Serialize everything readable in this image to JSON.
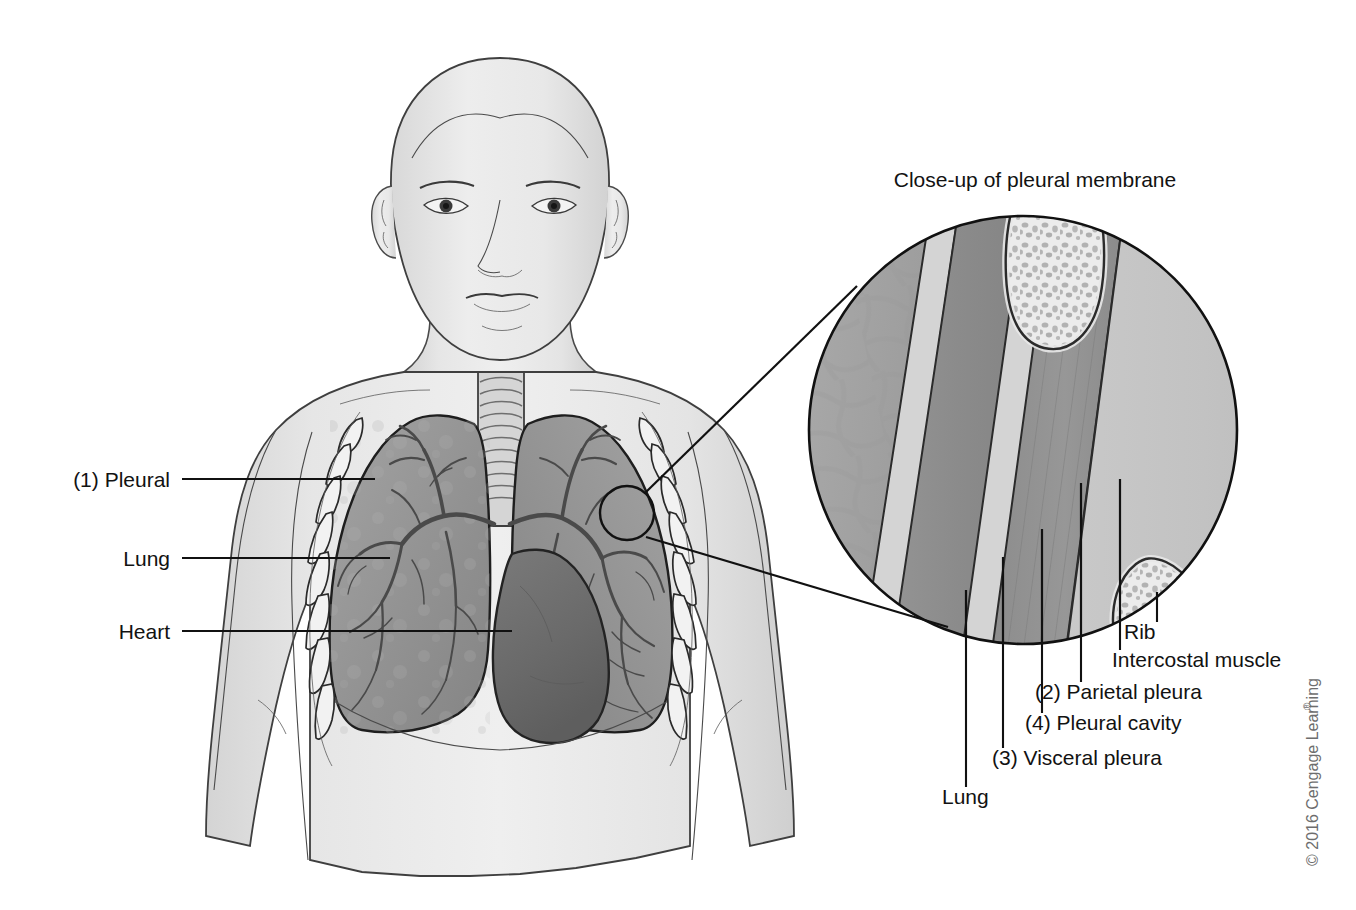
{
  "figure": {
    "title_caption": "Close-up of pleural membrane",
    "copyright": "© 2016 Cengage Learning",
    "copyright_mark": "®"
  },
  "left_labels": [
    {
      "id": "pleural",
      "text": "(1) Pleural",
      "text_x": 170,
      "text_y": 487,
      "line_x1": 182,
      "line_y1": 479,
      "line_x2": 375,
      "line_y2": 479
    },
    {
      "id": "lung",
      "text": "Lung",
      "text_x": 170,
      "text_y": 566,
      "line_x1": 182,
      "line_y1": 558,
      "line_x2": 390,
      "line_y2": 558
    },
    {
      "id": "heart",
      "text": "Heart",
      "text_x": 170,
      "text_y": 639,
      "line_x1": 182,
      "line_y1": 631,
      "line_x2": 510,
      "line_y2": 631
    }
  ],
  "right_labels": [
    {
      "id": "rib",
      "text": "Rib",
      "text_x": 1124,
      "text_y": 639,
      "line_x": 1157,
      "line_y1": 592,
      "line_y2": 622
    },
    {
      "id": "intercostal-muscle",
      "text": "Intercostal muscle",
      "text_x": 1112,
      "text_y": 667,
      "line_x": 1120,
      "line_y1": 479,
      "line_y2": 650
    },
    {
      "id": "parietal-pleura",
      "text": "(2) Parietal pleura",
      "text_x": 1035,
      "text_y": 699,
      "line_x": 1081,
      "line_y1": 483,
      "line_y2": 682
    },
    {
      "id": "pleural-cavity",
      "text": "(4) Pleural cavity",
      "text_x": 1025,
      "text_y": 730,
      "line_x": 1042,
      "line_y1": 529,
      "line_y2": 713
    },
    {
      "id": "visceral-pleura",
      "text": "(3) Visceral pleura",
      "text_x": 992,
      "text_y": 765,
      "line_x": 1003,
      "line_y1": 557,
      "line_y2": 748
    },
    {
      "id": "lung-closeup",
      "text": "Lung",
      "text_x": 942,
      "text_y": 804,
      "line_x": 966,
      "line_y1": 590,
      "line_y2": 787
    }
  ],
  "geometry": {
    "big_circle": {
      "cx": 1023,
      "cy": 430,
      "r": 216
    },
    "small_circle": {
      "cx": 627,
      "cy": 513,
      "r": 28
    },
    "tangent_upper": {
      "x1": 646,
      "y1": 492,
      "x2": 855,
      "y2": 288
    },
    "tangent_lower": {
      "x1": 646,
      "y1": 536,
      "x2": 945,
      "y2": 625
    }
  },
  "palette": {
    "paper": "#ffffff",
    "outline": "#111111",
    "body_skin": "#e9e9e9",
    "body_shade": "#d2d2d2",
    "lung_tissue": "#9b9b9b",
    "lung_dark": "#7a7a7a",
    "heart": "#6e6e6e",
    "trachea": "#cfcfcf",
    "rib_bone": "#e2e2e2",
    "rib_trabecula": "#b4b4b4",
    "closeup_lung": "#a8a8a8",
    "visceral_pleura": "#cfcfcf",
    "pleural_cavity": "#8e8e8e",
    "parietal_pleura": "#cccccc",
    "intercostal_muscle": "#9a9a9a",
    "subcutaneous": "#c4c4c4",
    "label_text": "#121212",
    "copyright_text": "#6d6d6d"
  },
  "closeup_layers": [
    {
      "name": "Lung",
      "key": "lung",
      "fill": "#a8a8a8"
    },
    {
      "name": "Visceral pleura",
      "key": "visceral_pleura",
      "fill": "#cfcfcf"
    },
    {
      "name": "Pleural cavity",
      "key": "pleural_cavity",
      "fill": "#8e8e8e"
    },
    {
      "name": "Parietal pleura",
      "key": "parietal_pleura",
      "fill": "#cccccc"
    },
    {
      "name": "Intercostal muscle",
      "key": "intercostal_muscle",
      "fill": "#9a9a9a"
    },
    {
      "name": "Rib",
      "key": "rib",
      "fill": "#e2e2e2"
    },
    {
      "name": "Subcutaneous tissue",
      "key": "subcutaneous",
      "fill": "#c4c4c4"
    }
  ]
}
